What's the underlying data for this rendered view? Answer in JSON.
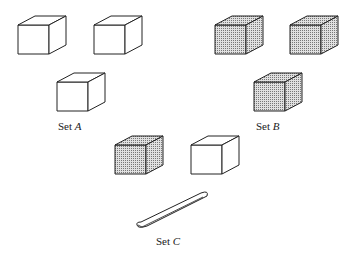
{
  "sets": [
    {
      "name": "Set",
      "letter": "A",
      "items": [
        "white cube",
        "white cube",
        "white cube"
      ]
    },
    {
      "name": "Set",
      "letter": "B",
      "items": [
        "shaded cube",
        "shaded cube",
        "shaded cube"
      ]
    },
    {
      "name": "Set",
      "letter": "C",
      "items": [
        "shaded cube",
        "white cube",
        "stick"
      ]
    }
  ],
  "colors": {
    "line": "#222222",
    "shade": "#bdbdbd",
    "white": "#ffffff"
  }
}
